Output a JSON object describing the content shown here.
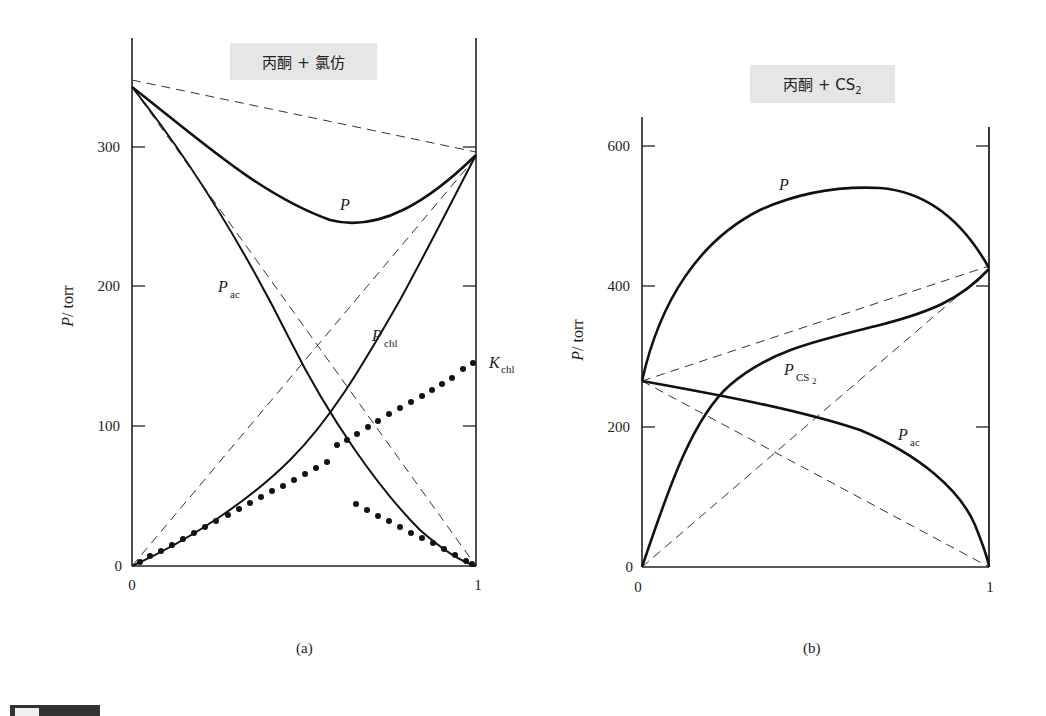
{
  "chart_data": [
    {
      "type": "line",
      "panel": "(a)",
      "title": "丙酮 + 氯仿",
      "xlabel": "",
      "ylabel": "P/torr",
      "xlim": [
        0,
        1
      ],
      "ylim": [
        0,
        360
      ],
      "xticks": [
        "0",
        "1"
      ],
      "yticks": [
        "0",
        "100",
        "200",
        "300"
      ],
      "grid": false,
      "x": [
        0,
        0.1,
        0.2,
        0.3,
        0.4,
        0.5,
        0.6,
        0.7,
        0.8,
        0.9,
        1.0
      ],
      "series": [
        {
          "name": "P",
          "style": "solid-thick",
          "values": [
            344,
            318,
            296,
            278,
            262,
            252,
            248,
            252,
            263,
            278,
            293
          ]
        },
        {
          "name": "P_ac",
          "style": "solid",
          "values": [
            344,
            300,
            258,
            216,
            174,
            132,
            95,
            62,
            36,
            15,
            0
          ]
        },
        {
          "name": "P_chl",
          "style": "solid",
          "values": [
            0,
            14,
            30,
            50,
            76,
            110,
            150,
            190,
            228,
            262,
            293
          ]
        },
        {
          "name": "K_chl",
          "style": "dotted",
          "values": [
            0,
            14,
            28,
            43,
            57,
            72,
            87,
            101,
            116,
            130,
            145
          ]
        },
        {
          "name": "K_chl (ac-rich)",
          "style": "dotted",
          "x_range": [
            0.65,
            1.0
          ],
          "values_at": {
            "0.65": 45,
            "0.75": 33,
            "0.85": 20,
            "0.95": 7,
            "1.0": 0
          }
        },
        {
          "name": "ideal P (Raoult)",
          "style": "dashed",
          "values": [
            348,
            295
          ]
        },
        {
          "name": "ideal P_ac (Raoult)",
          "style": "dashed",
          "values": [
            344,
            0
          ]
        },
        {
          "name": "ideal P_chl (Raoult)",
          "style": "dashed",
          "values": [
            0,
            293
          ]
        }
      ],
      "annotations": [
        "P",
        "P_ac",
        "P_chl",
        "K_chl"
      ]
    },
    {
      "type": "line",
      "panel": "(b)",
      "title": "丙酮 + CS2",
      "xlabel": "",
      "ylabel": "P/torr",
      "xlim": [
        0,
        1
      ],
      "ylim": [
        0,
        640
      ],
      "xticks": [
        "0",
        "1"
      ],
      "yticks": [
        "0",
        "200",
        "400",
        "600"
      ],
      "grid": false,
      "x": [
        0,
        0.1,
        0.2,
        0.3,
        0.4,
        0.5,
        0.6,
        0.7,
        0.8,
        0.9,
        1.0
      ],
      "series": [
        {
          "name": "P",
          "style": "solid-thick",
          "values": [
            265,
            395,
            460,
            498,
            522,
            535,
            540,
            538,
            525,
            490,
            425
          ]
        },
        {
          "name": "P_CS2",
          "style": "solid",
          "values": [
            0,
            140,
            230,
            282,
            315,
            335,
            350,
            365,
            378,
            395,
            425
          ]
        },
        {
          "name": "P_ac",
          "style": "solid",
          "values": [
            265,
            252,
            243,
            233,
            222,
            210,
            195,
            175,
            145,
            100,
            0
          ]
        },
        {
          "name": "ideal P (Raoult)",
          "style": "dashed",
          "values": [
            265,
            430
          ]
        },
        {
          "name": "ideal P_ac (Raoult)",
          "style": "dashed",
          "values": [
            265,
            0
          ]
        },
        {
          "name": "ideal P_CS2 (Raoult)",
          "style": "dashed",
          "values": [
            0,
            425
          ]
        }
      ],
      "annotations": [
        "P",
        "P_CS2",
        "P_ac"
      ]
    }
  ],
  "panels": {
    "a": {
      "title_main": "丙酮 + 氯仿",
      "caption": "(a)",
      "ylabel": "P/torr",
      "yticks": [
        "0",
        "100",
        "200",
        "300"
      ],
      "xticks": [
        "0",
        "1"
      ],
      "label_P": "P",
      "label_Pac": "P",
      "label_Pac_sub": "ac",
      "label_Pchl": "P",
      "label_Pchl_sub": "chl",
      "label_Kchl": "K",
      "label_Kchl_sub": "chl"
    },
    "b": {
      "title_main": "丙酮 + CS",
      "title_sub": "2",
      "caption": "(b)",
      "ylabel": "P/torr",
      "yticks": [
        "0",
        "200",
        "400",
        "600"
      ],
      "xticks": [
        "0",
        "1"
      ],
      "label_P": "P",
      "label_Pcs2": "P",
      "label_Pcs2_sub": "CS",
      "label_Pcs2_sub2": "2",
      "label_Pac": "P",
      "label_Pac_sub": "ac"
    }
  }
}
